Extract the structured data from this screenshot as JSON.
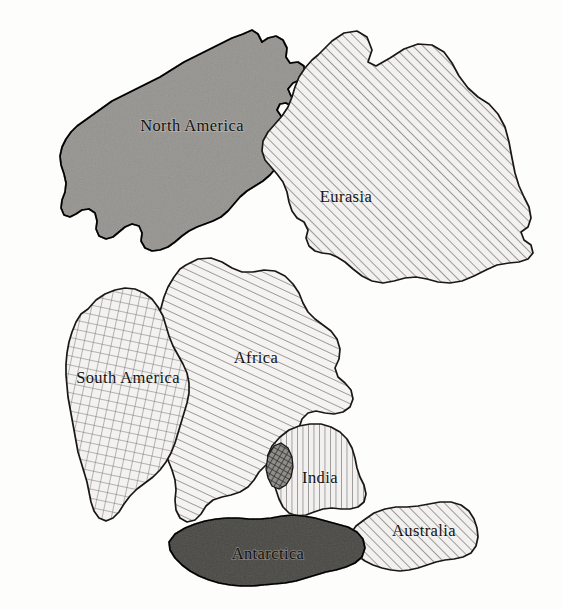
{
  "figure": {
    "background_color": "#fdfdfc",
    "ink_color": "#1a1714",
    "label_color": "#14120f",
    "width": 562,
    "height": 609
  },
  "legend_note": "",
  "continents": [
    {
      "id": "north-america",
      "label": "North America",
      "fill_style": "solid-gray",
      "fill_color": "#c6c5c2",
      "label_x": 192,
      "label_y": 131
    },
    {
      "id": "eurasia",
      "label": "Eurasia",
      "fill_style": "diagonal-hatch-right",
      "fill_color": "#f2f1ef",
      "label_x": 346,
      "label_y": 202
    },
    {
      "id": "africa",
      "label": "Africa",
      "fill_style": "diagonal-hatch-left",
      "fill_color": "#f4f3f1",
      "label_x": 256,
      "label_y": 363
    },
    {
      "id": "south-america",
      "label": "South America",
      "fill_style": "cross-hatch",
      "fill_color": "#f3f2f0",
      "label_x": 128,
      "label_y": 383
    },
    {
      "id": "india",
      "label": "India",
      "fill_style": "vertical-hatch",
      "fill_color": "#f2f1ef",
      "label_x": 320,
      "label_y": 483
    },
    {
      "id": "australia",
      "label": "Australia",
      "fill_style": "diagonal-hatch-right",
      "fill_color": "#f2f1ef",
      "label_x": 424,
      "label_y": 536
    },
    {
      "id": "antarctica",
      "label": "Antarctica",
      "fill_style": "solid-dark-gray",
      "fill_color": "#8d8c88",
      "label_x": 268,
      "label_y": 559
    }
  ],
  "overlap_region": {
    "id": "india-africa-overlap",
    "label": "",
    "fill_style": "dense-cross-hatch",
    "fill_color": "#6e6c68"
  }
}
